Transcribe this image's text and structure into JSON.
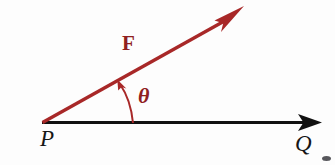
{
  "figure": {
    "background_color": "#fdfdfd",
    "width": 335,
    "height": 165,
    "labels": {
      "force_vector": "F",
      "angle": "θ",
      "origin_point": "P",
      "end_point": "Q"
    },
    "colors": {
      "force_red": "#a82828",
      "force_red_dark": "#8f2020",
      "baseline_black": "#111111",
      "label_black": "#161616"
    },
    "geometry": {
      "vertex": {
        "x": 42,
        "y": 123
      },
      "baseline_tip": {
        "x": 322,
        "y": 122
      },
      "force_tip": {
        "x": 244,
        "y": 6
      },
      "angle_arc_base": {
        "x": 133,
        "y": 123
      },
      "angle_arc_tip": {
        "x": 118,
        "y": 80
      },
      "angle_degrees": 23
    },
    "icons": {
      "force_arrowhead": "arrowhead-icon",
      "baseline_arrowhead": "arrowhead-icon",
      "angle_arrowhead": "arrowhead-icon"
    }
  }
}
